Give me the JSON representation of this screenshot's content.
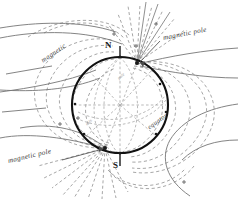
{
  "figure": {
    "background_color": "#ffffff",
    "globe": {
      "outline_color": "#111111",
      "center": [
        120,
        105
      ],
      "radius": 48,
      "label_north": "N",
      "label_south": "S"
    },
    "labels": {
      "magnetic_pole_north": "magnetic pole",
      "magnetic_pole_south": "magnetic pole",
      "magnetic": "magnetic",
      "equator": "equator",
      "faint_inner_a": "pole",
      "faint_inner_b": "axis"
    },
    "colors": {
      "globe_stroke": "#111111",
      "field_line_dashed": "#8c8c8c",
      "solid_curve": "#6f6f6f",
      "label_text": "#3a3a3a",
      "cardinal_text": "#1a1a1a",
      "faint_text": "#9a9a9a"
    },
    "elements": {
      "dashed_field_lines": "magnetic field meridian loops",
      "radiating_lines_north": "field lines radiating from north magnetic pole",
      "radiating_lines_south": "field lines radiating from south magnetic pole",
      "solid_isogonic_curves": "solid curves crossing the field",
      "pole_markers": "dot markers on globe rim"
    }
  }
}
